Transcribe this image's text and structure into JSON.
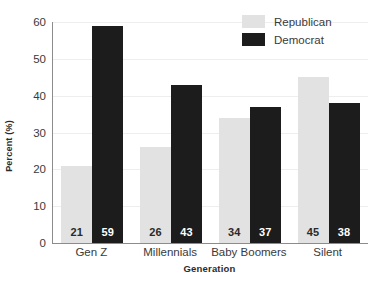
{
  "chart_data": {
    "type": "bar",
    "title": "",
    "subtitle": "",
    "xlabel": "Generation",
    "ylabel": "Percent (%)",
    "categories": [
      "Gen Z",
      "Millennials",
      "Baby Boomers",
      "Silent"
    ],
    "series": [
      {
        "name": "Republican",
        "values": [
          21,
          26,
          34,
          45
        ],
        "color": "#e2e2e2"
      },
      {
        "name": "Democrat",
        "values": [
          59,
          43,
          37,
          38
        ],
        "color": "#1c1c1c"
      }
    ],
    "ylim": [
      0,
      60
    ],
    "yticks": [
      0,
      10,
      20,
      30,
      40,
      50,
      60
    ],
    "ytick_labels": [
      "0",
      "10",
      "20",
      "30",
      "40",
      "50",
      "60"
    ],
    "grid": true,
    "grid_axis": "y",
    "legend_position": "top-right",
    "data_labels": true,
    "bar_labels": [
      {
        "category": "Gen Z",
        "Republican": "21",
        "Democrat": "59"
      },
      {
        "category": "Millennials",
        "Republican": "26",
        "Democrat": "43"
      },
      {
        "category": "Baby Boomers",
        "Republican": "34",
        "Democrat": "37"
      },
      {
        "category": "Silent",
        "Republican": "45",
        "Democrat": "38"
      }
    ]
  },
  "legend": {
    "items": [
      {
        "label": "Republican",
        "swatch": "rep"
      },
      {
        "label": "Democrat",
        "swatch": "dem"
      }
    ]
  },
  "axes": {
    "y_title": "Percent (%)",
    "x_title": "Generation",
    "y_ticks": [
      "60",
      "50",
      "40",
      "30",
      "20",
      "10",
      "0"
    ],
    "x_ticks": [
      "Gen Z",
      "Millennials",
      "Baby Boomers",
      "Silent"
    ]
  },
  "colors": {
    "republican": "#e2e2e2",
    "democrat": "#1c1c1c",
    "axis": "#8c8c8c",
    "grid": "#eeeeee",
    "text": "#3a3a3a",
    "background": "#ffffff"
  }
}
